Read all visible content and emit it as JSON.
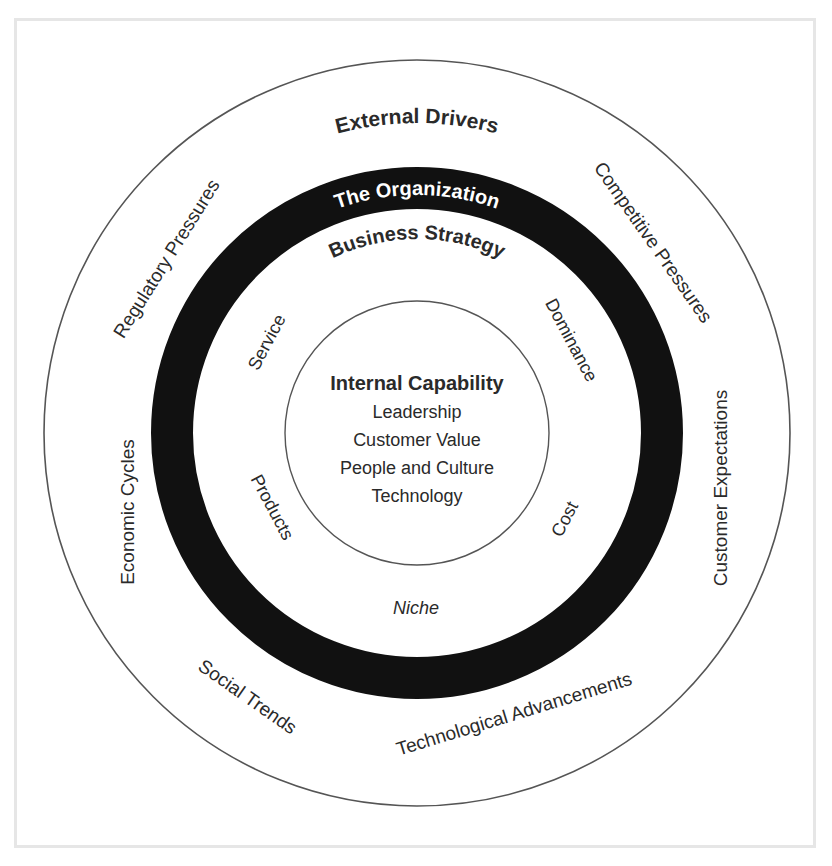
{
  "diagram": {
    "outer_ring": {
      "title": "External Drivers",
      "drivers": [
        "Regulatory Pressures",
        "Competitive Pressures",
        "Economic Cycles",
        "Customer Expectations",
        "Social Trends",
        "Technological Advancements"
      ]
    },
    "organization_band": {
      "label": "The Organization",
      "color": "#111111"
    },
    "strategy_ring": {
      "title": "Business Strategy",
      "strategies": [
        "Service",
        "Dominance",
        "Products",
        "Cost",
        "Niche"
      ]
    },
    "core": {
      "title": "Internal Capability",
      "items": [
        "Leadership",
        "Customer Value",
        "People and Culture",
        "Technology"
      ]
    }
  }
}
